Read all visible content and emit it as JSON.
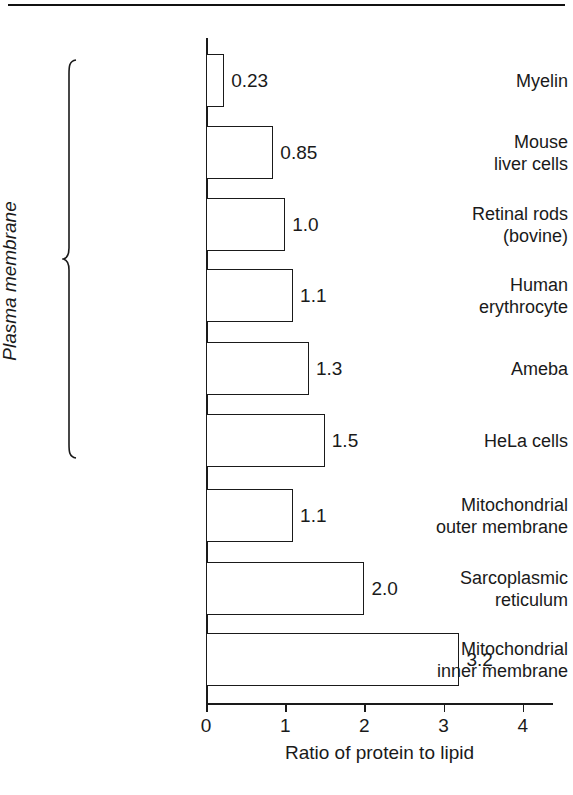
{
  "figure": {
    "group_bracket_label": "Plasma membrane"
  },
  "chart_data": {
    "type": "bar",
    "orientation": "horizontal",
    "title": "",
    "xlabel": "Ratio of protein to lipid",
    "ylabel": "",
    "xlim": [
      0,
      4.4
    ],
    "xticks": [
      "0",
      "1",
      "2",
      "3",
      "4"
    ],
    "xtick_values": [
      0,
      1,
      2,
      3,
      4
    ],
    "grid": false,
    "legend": null,
    "bar_fill_color": "#ffffff",
    "bar_edge_color": "#1a1a1a",
    "categories": [
      "Myelin",
      "Mouse liver cells",
      "Retinal rods (bovine)",
      "Human erythrocyte",
      "Ameba",
      "HeLa cells",
      "Mitochondrial outer membrane",
      "Sarcoplasmic reticulum",
      "Mitochondrial inner membrane"
    ],
    "values": [
      0.23,
      0.85,
      1.0,
      1.1,
      1.3,
      1.5,
      1.1,
      2.0,
      3.2
    ],
    "value_labels": [
      "0.23",
      "0.85",
      "1.0",
      "1.1",
      "1.3",
      "1.1",
      "1.5",
      "2.0",
      "3.2"
    ],
    "bars": [
      {
        "label_lines": [
          "Myelin"
        ],
        "value": 0.23,
        "value_label": "0.23",
        "group": "Plasma membrane"
      },
      {
        "label_lines": [
          "Mouse",
          "liver cells"
        ],
        "value": 0.85,
        "value_label": "0.85",
        "group": "Plasma membrane"
      },
      {
        "label_lines": [
          "Retinal rods",
          "(bovine)"
        ],
        "value": 1.0,
        "value_label": "1.0",
        "group": "Plasma membrane"
      },
      {
        "label_lines": [
          "Human",
          "erythrocyte"
        ],
        "value": 1.1,
        "value_label": "1.1",
        "group": "Plasma membrane"
      },
      {
        "label_lines": [
          "Ameba"
        ],
        "value": 1.3,
        "value_label": "1.3",
        "group": "Plasma membrane"
      },
      {
        "label_lines": [
          "HeLa cells"
        ],
        "value": 1.5,
        "value_label": "1.5",
        "group": "Plasma membrane"
      },
      {
        "label_lines": [
          "Mitochondrial",
          "outer membrane"
        ],
        "value": 1.1,
        "value_label": "1.1",
        "group": ""
      },
      {
        "label_lines": [
          "Sarcoplasmic",
          "reticulum"
        ],
        "value": 2.0,
        "value_label": "2.0",
        "group": ""
      },
      {
        "label_lines": [
          "Mitochondrial",
          "inner membrane"
        ],
        "value": 3.2,
        "value_label": "3.2",
        "group": ""
      }
    ]
  }
}
